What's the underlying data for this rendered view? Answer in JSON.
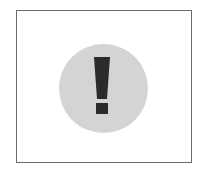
{
  "icon": {
    "name": "exclamation-alert-icon",
    "glyph": "!",
    "colors": {
      "frame_border": "#6b6b6b",
      "circle_fill": "#d4d4d4",
      "mark_fill": "#2b2b2b",
      "background": "#ffffff"
    }
  }
}
